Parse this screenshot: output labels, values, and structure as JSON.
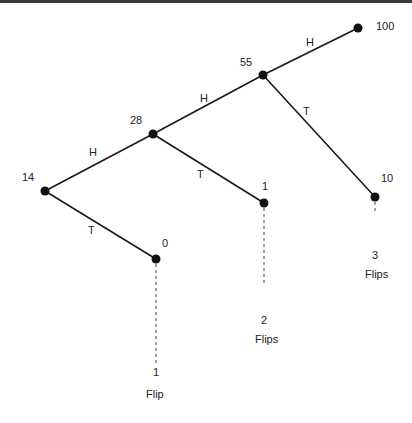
{
  "diagram": {
    "type": "binary-tree",
    "nodes": [
      {
        "id": "n14",
        "label": "14",
        "x": 45,
        "y": 191,
        "lx": 22,
        "ly": 171
      },
      {
        "id": "n28",
        "label": "28",
        "x": 153,
        "y": 134,
        "lx": 130,
        "ly": 114
      },
      {
        "id": "n55",
        "label": "55",
        "x": 263,
        "y": 75,
        "lx": 240,
        "ly": 56
      },
      {
        "id": "n100",
        "label": "100",
        "x": 358,
        "y": 28,
        "lx": 376,
        "ly": 20
      },
      {
        "id": "n10",
        "label": "10",
        "x": 375,
        "y": 197,
        "lx": 381,
        "ly": 172
      },
      {
        "id": "n1",
        "label": "1",
        "x": 264,
        "y": 203,
        "lx": 264,
        "ly": 180
      },
      {
        "id": "n0",
        "label": "0",
        "x": 156,
        "y": 259,
        "lx": 162,
        "ly": 237
      }
    ],
    "edges": [
      {
        "from": "n14",
        "to": "n28",
        "label": "H",
        "lx": 92,
        "ly": 151
      },
      {
        "from": "n14",
        "to": "n0",
        "label": "T",
        "lx": 88,
        "ly": 225
      },
      {
        "from": "n28",
        "to": "n55",
        "label": "H",
        "lx": 200,
        "ly": 96
      },
      {
        "from": "n28",
        "to": "n1",
        "label": "T",
        "lx": 198,
        "ly": 170
      },
      {
        "from": "n55",
        "to": "n100",
        "label": "H",
        "lx": 306,
        "ly": 40
      },
      {
        "from": "n55",
        "to": "n10",
        "label": "T",
        "lx": 304,
        "ly": 110
      }
    ],
    "flip_markers": [
      {
        "node": "n0",
        "x": 156,
        "y_end": 400,
        "count": "1",
        "unit": "Flip"
      },
      {
        "node": "n1",
        "x": 264,
        "y_end": 317,
        "count": "2",
        "unit": "Flips"
      },
      {
        "node": "n10",
        "x": 375,
        "y_end": 246,
        "count": "3",
        "unit": "Flips"
      }
    ]
  }
}
